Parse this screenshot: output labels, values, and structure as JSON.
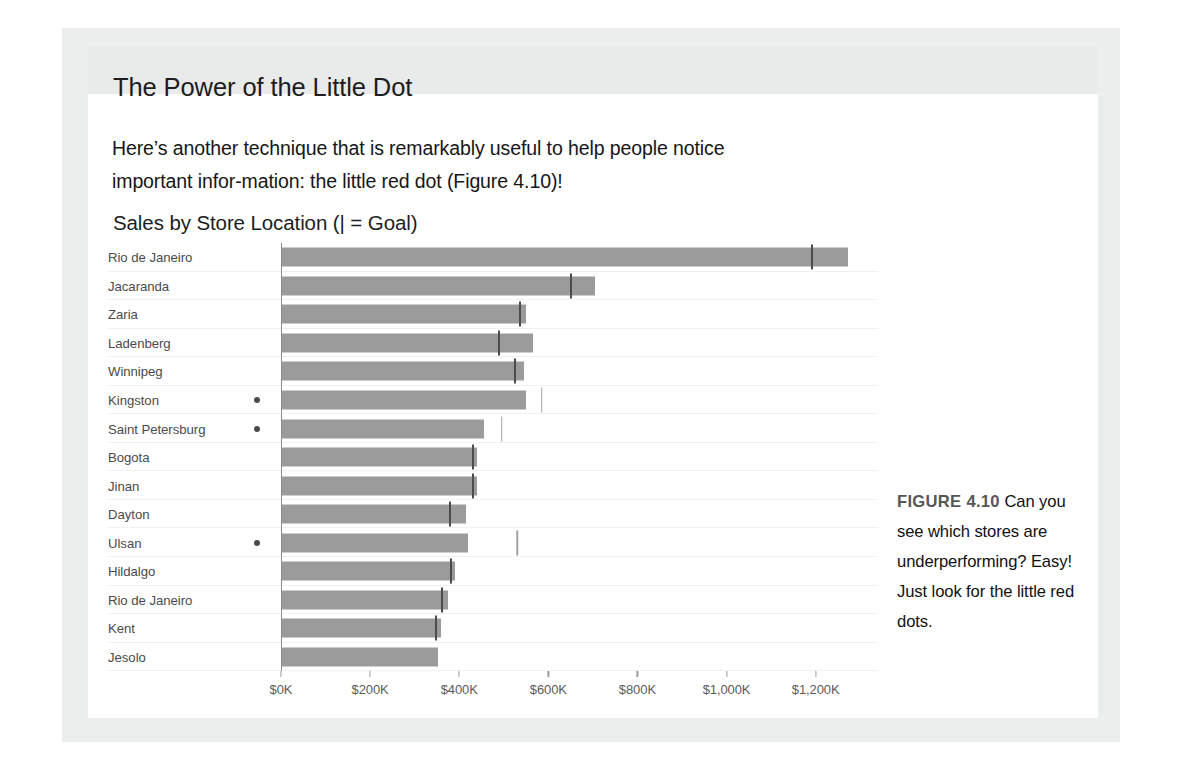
{
  "section": {
    "title": "The Power of the Little Dot",
    "paragraph": "Here’s another technique that is remarkably useful to help people notice important infor-mation: the little red dot (Figure 4.10)!"
  },
  "figure": {
    "label": "FIGURE 4.10",
    "caption": "Can you see which stores are underperforming? Easy! Just look for the little red dots."
  },
  "colors": {
    "bar": "#9b9b9b",
    "goal_inside": "#4c4c4c",
    "goal_outside": "#a2a2a2",
    "dot": "#4a4a4a",
    "page_border": "#eceded",
    "heading_band": "#e9eaea"
  },
  "chart_data": {
    "type": "bar",
    "orientation": "horizontal",
    "title": "Sales by Store Location (| = Goal)",
    "xlabel": "",
    "ylabel": "",
    "xlim": [
      0,
      1340
    ],
    "xticks": [
      0,
      200,
      400,
      600,
      800,
      1000,
      1200
    ],
    "xtick_labels": [
      "$0K",
      "$200K",
      "$400K",
      "$600K",
      "$800K",
      "$1,000K",
      "$1,200K"
    ],
    "units": "thousands of dollars",
    "grid": false,
    "legend": "none",
    "series_names": [
      "Sales",
      "Goal"
    ],
    "categories": [
      "Rio de Janeiro",
      "Jacaranda",
      "Zaria",
      "Ladenberg",
      "Winnipeg",
      "Kingston",
      "Saint Petersburg",
      "Bogota",
      "Jinan",
      "Dayton",
      "Ulsan",
      "Hildalgo",
      "Rio de Janeiro",
      "Kent",
      "Jesolo"
    ],
    "values": [
      1272,
      705,
      550,
      565,
      545,
      550,
      455,
      440,
      440,
      415,
      420,
      390,
      375,
      360,
      352
    ],
    "goals": [
      1192,
      652,
      537,
      490,
      525,
      585,
      495,
      432,
      430,
      380,
      530,
      382,
      362,
      348,
      null
    ],
    "underperforming_flags": [
      false,
      false,
      false,
      false,
      false,
      true,
      true,
      false,
      false,
      false,
      true,
      false,
      false,
      false,
      false
    ],
    "annotations": [
      {
        "category": "Kingston",
        "marker": "red-dot"
      },
      {
        "category": "Saint Petersburg",
        "marker": "red-dot"
      },
      {
        "category": "Ulsan",
        "marker": "red-dot"
      }
    ]
  }
}
